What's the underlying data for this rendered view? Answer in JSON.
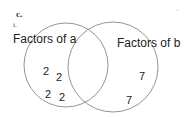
{
  "header": {
    "part_label": "c.",
    "sub_label": "i."
  },
  "venn": {
    "set_a": {
      "label": "Factors of a",
      "elements": [
        "2",
        "2",
        "2",
        "2"
      ]
    },
    "set_b": {
      "label": "Factors of b",
      "elements": [
        "7",
        "7"
      ]
    },
    "intersection": {
      "elements": []
    },
    "stroke_color": "#888888"
  }
}
